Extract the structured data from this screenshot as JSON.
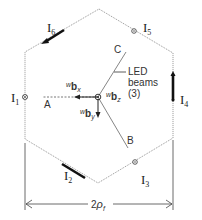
{
  "diagram": {
    "currents": [
      {
        "id": "I1",
        "base": "I",
        "sub": "1",
        "symbol": "out-of-plane"
      },
      {
        "id": "I2",
        "base": "I",
        "sub": "2",
        "symbol": "in-plane"
      },
      {
        "id": "I3",
        "base": "I",
        "sub": "3",
        "symbol": "out-of-plane"
      },
      {
        "id": "I4",
        "base": "I",
        "sub": "4",
        "symbol": "in-plane"
      },
      {
        "id": "I5",
        "base": "I",
        "sub": "5",
        "symbol": "out-of-plane"
      },
      {
        "id": "I6",
        "base": "I",
        "sub": "6",
        "symbol": "in-plane"
      }
    ],
    "beams": {
      "labels": [
        "A",
        "B",
        "C"
      ],
      "annotation_line1": "LED",
      "annotation_line2": "beams",
      "annotation_line3": "(3)"
    },
    "vectors": {
      "x": {
        "prefix": "w",
        "base": "b",
        "sub": "x"
      },
      "y": {
        "prefix": "w",
        "base": "b",
        "sub": "y"
      },
      "z": {
        "prefix": "w",
        "base": "b",
        "sub": "z"
      }
    },
    "dimension": {
      "coef": "2",
      "symbol": "ρ",
      "sub": "f"
    }
  }
}
